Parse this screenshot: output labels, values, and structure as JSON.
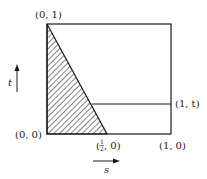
{
  "diagram": {
    "labels": {
      "top_left": "(0, 1)",
      "bottom_left": "(0, 0)",
      "bottom_mid_open": "(",
      "bottom_mid_frac_num": "1",
      "bottom_mid_frac_den": "2",
      "bottom_mid_close": ", 0)",
      "bottom_right": "(1, 0)",
      "right_mid": "(1, t)",
      "axis_t": "t",
      "axis_s": "s"
    },
    "colors": {
      "line": "#1a1a1a",
      "background": "#ffffff"
    }
  }
}
